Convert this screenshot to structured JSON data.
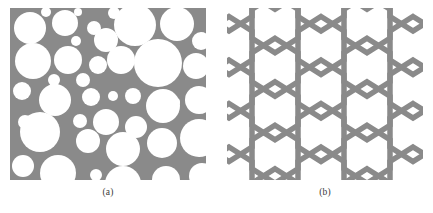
{
  "figure": {
    "background_color": "#ffffff",
    "material_color": "#8a8a8a",
    "pore_color": "#ffffff",
    "width": 433,
    "height": 213
  },
  "panels": [
    {
      "id": "a",
      "caption": "(a)",
      "type": "random-circular-pore-structure",
      "description": "Cross-section of a closed-cell foam with randomly sized and packed circular pores in a gray solid matrix",
      "x": 10,
      "y": 8,
      "width": 196,
      "height": 172,
      "circles": [
        {
          "cx": 20,
          "cy": 20,
          "r": 16
        },
        {
          "cx": 55,
          "cy": 15,
          "r": 13
        },
        {
          "cx": 84,
          "cy": 20,
          "r": 7
        },
        {
          "cx": 66,
          "cy": 33,
          "r": 5
        },
        {
          "cx": 96,
          "cy": 32,
          "r": 12
        },
        {
          "cx": 125,
          "cy": 17,
          "r": 21
        },
        {
          "cx": 167,
          "cy": 16,
          "r": 17
        },
        {
          "cx": 191,
          "cy": 33,
          "r": 9
        },
        {
          "cx": 23,
          "cy": 53,
          "r": 18
        },
        {
          "cx": 58,
          "cy": 52,
          "r": 14
        },
        {
          "cx": 88,
          "cy": 57,
          "r": 9
        },
        {
          "cx": 111,
          "cy": 52,
          "r": 14
        },
        {
          "cx": 148,
          "cy": 55,
          "r": 24
        },
        {
          "cx": 186,
          "cy": 58,
          "r": 13
        },
        {
          "cx": 44,
          "cy": 72,
          "r": 6
        },
        {
          "cx": 73,
          "cy": 72,
          "r": 7
        },
        {
          "cx": 12,
          "cy": 83,
          "r": 9
        },
        {
          "cx": 45,
          "cy": 92,
          "r": 16
        },
        {
          "cx": 81,
          "cy": 89,
          "r": 9
        },
        {
          "cx": 103,
          "cy": 88,
          "r": 5
        },
        {
          "cx": 123,
          "cy": 88,
          "r": 8
        },
        {
          "cx": 153,
          "cy": 98,
          "r": 17
        },
        {
          "cx": 189,
          "cy": 92,
          "r": 14
        },
        {
          "cx": 15,
          "cy": 114,
          "r": 7
        },
        {
          "cx": 70,
          "cy": 113,
          "r": 7
        },
        {
          "cx": 96,
          "cy": 114,
          "r": 13
        },
        {
          "cx": 126,
          "cy": 119,
          "r": 11
        },
        {
          "cx": 30,
          "cy": 124,
          "r": 20
        },
        {
          "cx": 78,
          "cy": 133,
          "r": 12
        },
        {
          "cx": 113,
          "cy": 141,
          "r": 17
        },
        {
          "cx": 152,
          "cy": 135,
          "r": 15
        },
        {
          "cx": 189,
          "cy": 130,
          "r": 19
        },
        {
          "cx": 13,
          "cy": 158,
          "r": 11
        },
        {
          "cx": 48,
          "cy": 165,
          "r": 18
        },
        {
          "cx": 86,
          "cy": 167,
          "r": 6
        },
        {
          "cx": 113,
          "cy": 176,
          "r": 18
        },
        {
          "cx": 156,
          "cy": 172,
          "r": 14
        },
        {
          "cx": 192,
          "cy": 168,
          "r": 13
        },
        {
          "cx": 36,
          "cy": 4,
          "r": 5
        },
        {
          "cx": 104,
          "cy": 5,
          "r": 6
        },
        {
          "cx": 166,
          "cy": 94,
          "r": 4
        },
        {
          "cx": 68,
          "cy": 4,
          "r": 4
        }
      ]
    },
    {
      "id": "b",
      "caption": "(b)",
      "type": "regular-hexagonal-honeycomb",
      "description": "Regular honeycomb lattice of uniform pointy-top hexagonal cells with gray cell walls",
      "x": 227,
      "y": 8,
      "width": 196,
      "height": 172,
      "lattice": {
        "orientation": "pointy-top",
        "cell_width": 46,
        "cell_height": 58,
        "wall_thickness": 5.5,
        "columns": 5,
        "rows": 5,
        "origin_x": 2,
        "origin_y": -6
      }
    }
  ]
}
